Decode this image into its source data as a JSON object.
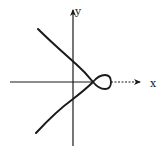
{
  "diagram": {
    "type": "curve-sketch",
    "axes": {
      "x_label": "x",
      "y_label": "y",
      "origin": [
        73,
        82
      ],
      "x_axis": {
        "from": [
          10,
          82
        ],
        "to": [
          141,
          82
        ]
      },
      "y_axis": {
        "from": [
          73,
          146
        ],
        "to": [
          73,
          9
        ]
      }
    },
    "curve": {
      "node_point": [
        93,
        82
      ],
      "upper_branch_start": [
        38,
        29
      ],
      "lower_branch_start": [
        36,
        133
      ],
      "loop": {
        "left": 93,
        "right": 111,
        "top": 75,
        "bottom": 89
      }
    },
    "colors": {
      "ink": "#1a1a1a",
      "background": "#ffffff"
    }
  }
}
